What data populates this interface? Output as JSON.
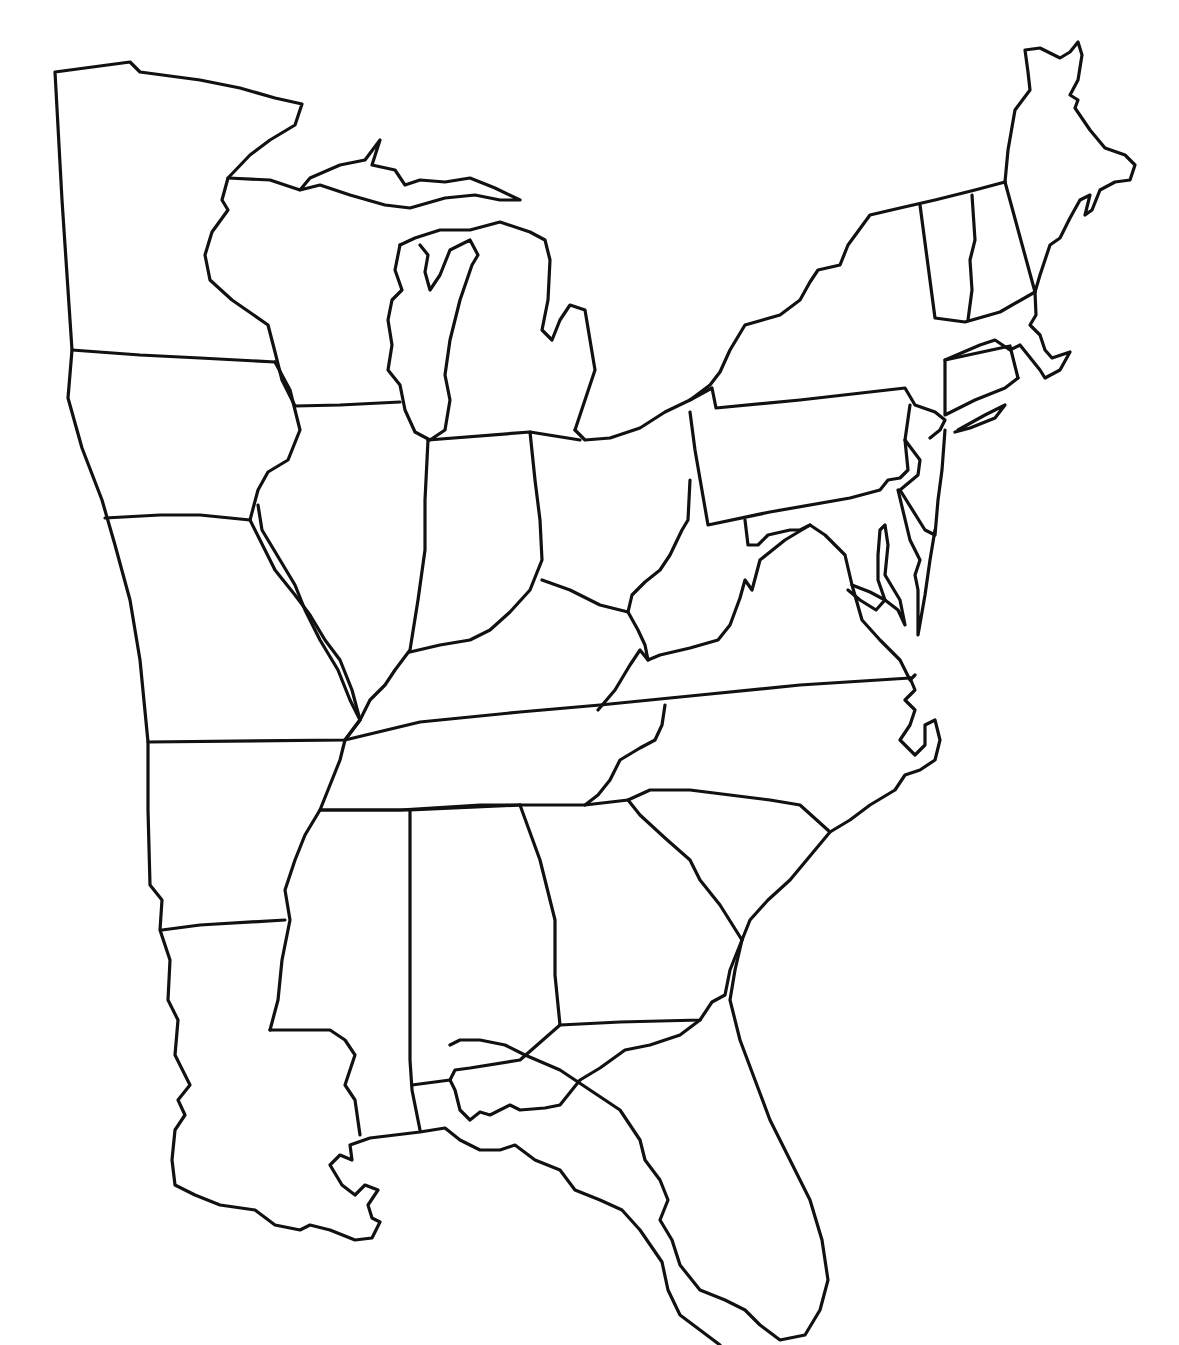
{
  "map": {
    "title": "",
    "type": "blank outline map",
    "region": "Eastern United States",
    "style": {
      "background": "#ffffff",
      "stroke": "#111111"
    },
    "labels": []
  }
}
